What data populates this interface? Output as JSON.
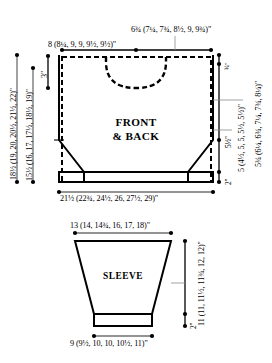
{
  "diagram": {
    "type": "knitting-schematic",
    "ink_color": "#000000",
    "guide_color": "#7a7a7a",
    "background": "#ffffff"
  },
  "front_back": {
    "piece_label_line1": "FRONT",
    "piece_label_line2": "& BACK",
    "measurements": {
      "shoulder_to_shoulder_top": "6¾ (7¼, 7¾, 8½, 9, 9¾)\"",
      "shoulder_width": "8 (8¼, 9, 9, 9½, 9½)\"",
      "total_length": "18½ (19, 20, 20½, 21½, 22)\"",
      "length_to_underarm": "15½ (16, 17, 17½, 18½, 19)\"",
      "neck_depth": "3\"",
      "neck_ribbing": "¾\"",
      "armhole_depth": "5¾ (6¼, 6¾, 7¼, 7¾, 8¼)\"",
      "side_seam": "5 (4½, 5, 5, 5½, 5½)\"",
      "taper_height": "5½\"",
      "hem_ribbing": "2\"",
      "bottom_width": "21½ (22¾, 24½, 26, 27½, 29)\""
    }
  },
  "sleeve": {
    "piece_label": "SLEEVE",
    "measurements": {
      "upper_arm": "13 (14, 14¾, 16, 17, 18)\"",
      "sleeve_length": "11 (11, 11½, 11¾, 12, 12)\"",
      "cuff_ribbing": "2\"",
      "cuff_width": "9 (9½, 10, 10, 10½, 11)\""
    }
  }
}
